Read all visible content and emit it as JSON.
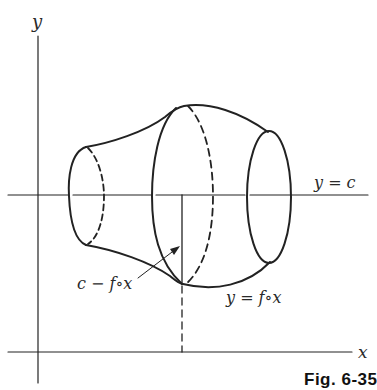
{
  "figure": {
    "axes": {
      "x_label": "x",
      "y_label": "y"
    },
    "labels": {
      "horizontal_line": "y = c",
      "distance": "c − f∘x",
      "curve": "y = f∘x"
    },
    "caption": "Fig. 6-35"
  }
}
